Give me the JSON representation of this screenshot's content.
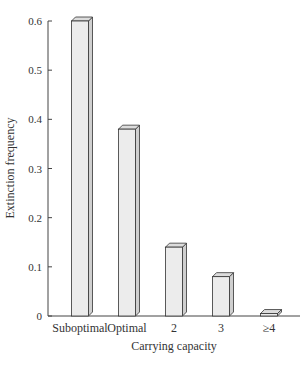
{
  "chart_data": {
    "type": "bar",
    "title": "",
    "xlabel": "Carrying capacity",
    "ylabel": "Extinction frequency",
    "categories": [
      "Suboptimal",
      "Optimal",
      "2",
      "3",
      "≥4"
    ],
    "values": [
      0.6,
      0.38,
      0.14,
      0.08,
      0.005
    ],
    "ylim": [
      0,
      0.6
    ],
    "yticks": [
      "0",
      "0.1",
      "0.2",
      "0.3",
      "0.4",
      "0.5",
      "0.6"
    ],
    "grid": false,
    "legend": null,
    "style": "3d-bar",
    "colors": {
      "bar_face": "#ececec",
      "bar_side": "#cfcfcf",
      "bar_top": "#dcdcdc",
      "stroke": "#333333"
    }
  }
}
